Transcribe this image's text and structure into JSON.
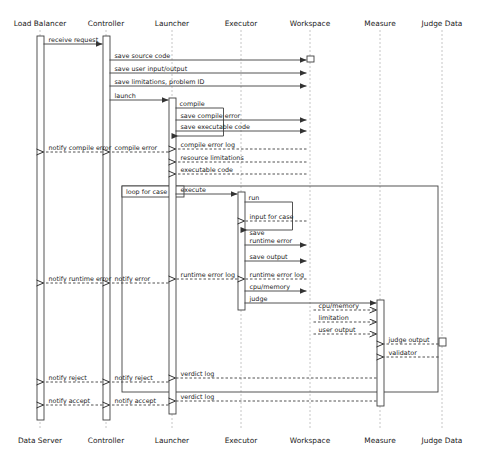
{
  "diagram": {
    "type": "uml-sequence-diagram",
    "title": "",
    "colors": {
      "line": "#404040",
      "text": "#1a1a1a",
      "activation_fill": "#ffffff",
      "background": "#ffffff"
    },
    "header_participants": [
      {
        "id": "load_balancer",
        "label": "Load Balancer",
        "x": 40
      },
      {
        "id": "controller",
        "label": "Controller",
        "x": 106
      },
      {
        "id": "launcher",
        "label": "Launcher",
        "x": 172
      },
      {
        "id": "executor",
        "label": "Executor",
        "x": 241
      },
      {
        "id": "workspace",
        "label": "Workspace",
        "x": 310
      },
      {
        "id": "measure",
        "label": "Measure",
        "x": 380
      },
      {
        "id": "judge_data",
        "label": "Judge Data",
        "x": 442
      }
    ],
    "footer_participants": [
      {
        "id": "data_server",
        "label": "Data Server",
        "x": 40
      },
      {
        "id": "controller",
        "label": "Controller",
        "x": 106
      },
      {
        "id": "launcher",
        "label": "Launcher",
        "x": 172
      },
      {
        "id": "executor",
        "label": "Executor",
        "x": 241
      },
      {
        "id": "workspace",
        "label": "Workspace",
        "x": 310
      },
      {
        "id": "measure",
        "label": "Measure",
        "x": 380
      },
      {
        "id": "judge_data",
        "label": "Judge Data",
        "x": 442
      }
    ],
    "fragments": [
      {
        "id": "loop-for-case",
        "label": "loop for case",
        "x": 122,
        "y": 186,
        "width": 316,
        "height": 206
      }
    ],
    "messages": [
      {
        "id": "m1",
        "label": "receive request",
        "from": "load_balancer",
        "to": "controller",
        "y": 44,
        "style": "solid",
        "dir": "right"
      },
      {
        "id": "m2",
        "label": "save source code",
        "from": "controller",
        "to": "workspace",
        "y": 60,
        "style": "solid",
        "dir": "right"
      },
      {
        "id": "m3",
        "label": "save user input/output",
        "from": "controller",
        "to": "workspace",
        "y": 73,
        "style": "solid",
        "dir": "right"
      },
      {
        "id": "m4",
        "label": "save limitations, problem ID",
        "from": "controller",
        "to": "workspace",
        "y": 86,
        "style": "solid",
        "dir": "right"
      },
      {
        "id": "m5",
        "label": "launch",
        "from": "controller",
        "to": "launcher",
        "y": 100,
        "style": "solid",
        "dir": "right"
      },
      {
        "id": "m6",
        "label": "compile",
        "from": "launcher",
        "to": "launcher",
        "y": 108,
        "style": "solid",
        "dir": "self"
      },
      {
        "id": "m7",
        "label": "save compile error",
        "from": "launcher",
        "to": "workspace",
        "y": 120,
        "style": "solid",
        "dir": "right"
      },
      {
        "id": "m8",
        "label": "save executable code",
        "from": "launcher",
        "to": "workspace",
        "y": 131,
        "style": "solid",
        "dir": "right"
      },
      {
        "id": "m9",
        "label": "compile error log",
        "from": "workspace",
        "to": "launcher",
        "y": 149,
        "style": "dashed",
        "dir": "left"
      },
      {
        "id": "m10",
        "label": "resource limitations",
        "from": "workspace",
        "to": "launcher",
        "y": 162,
        "style": "dashed",
        "dir": "left"
      },
      {
        "id": "m11",
        "label": "executable code",
        "from": "workspace",
        "to": "launcher",
        "y": 174,
        "style": "dashed",
        "dir": "left"
      },
      {
        "id": "m12",
        "label": "compile error",
        "from": "launcher",
        "to": "controller",
        "y": 152,
        "style": "dashed",
        "dir": "left"
      },
      {
        "id": "m13",
        "label": "notify compile error",
        "from": "controller",
        "to": "load_balancer",
        "y": 152,
        "style": "dashed",
        "dir": "left"
      },
      {
        "id": "m14",
        "label": "execute",
        "from": "launcher",
        "to": "executor",
        "y": 194,
        "style": "solid",
        "dir": "right"
      },
      {
        "id": "m15",
        "label": "run",
        "from": "executor",
        "to": "executor",
        "y": 202,
        "style": "solid",
        "dir": "self"
      },
      {
        "id": "m16",
        "label": "input for case",
        "from": "workspace",
        "to": "executor",
        "y": 221,
        "style": "dashed",
        "dir": "left"
      },
      {
        "id": "m17",
        "label": "save\nruntime error",
        "from": "executor",
        "to": "workspace",
        "y": 245,
        "style": "solid",
        "dir": "right"
      },
      {
        "id": "m18",
        "label": "save output",
        "from": "executor",
        "to": "workspace",
        "y": 261,
        "style": "solid",
        "dir": "right"
      },
      {
        "id": "m19",
        "label": "runtime error log",
        "from": "workspace",
        "to": "executor",
        "y": 279,
        "style": "dashed",
        "dir": "left"
      },
      {
        "id": "m20",
        "label": "runtime error log",
        "from": "executor",
        "to": "launcher",
        "y": 279,
        "style": "dashed",
        "dir": "left"
      },
      {
        "id": "m21",
        "label": "notify error",
        "from": "launcher",
        "to": "controller",
        "y": 283,
        "style": "dashed",
        "dir": "left"
      },
      {
        "id": "m22",
        "label": "notify runtime error",
        "from": "controller",
        "to": "load_balancer",
        "y": 283,
        "style": "dashed",
        "dir": "left"
      },
      {
        "id": "m23",
        "label": "cpu/memory",
        "from": "executor",
        "to": "workspace",
        "y": 291,
        "style": "solid",
        "dir": "right"
      },
      {
        "id": "m24",
        "label": "judge",
        "from": "executor",
        "to": "measure",
        "y": 303,
        "style": "solid",
        "dir": "right"
      },
      {
        "id": "m25",
        "label": "cpu/memory",
        "from": "workspace",
        "to": "measure",
        "y": 310,
        "style": "dashed",
        "dir": "right"
      },
      {
        "id": "m26",
        "label": "limitation",
        "from": "workspace",
        "to": "measure",
        "y": 322,
        "style": "dashed",
        "dir": "right"
      },
      {
        "id": "m27",
        "label": "user output",
        "from": "workspace",
        "to": "measure",
        "y": 334,
        "style": "dashed",
        "dir": "right"
      },
      {
        "id": "m28",
        "label": "judge output",
        "from": "judge_data",
        "to": "measure",
        "y": 344,
        "style": "dashed",
        "dir": "left"
      },
      {
        "id": "m29",
        "label": "validator",
        "from": "judge_data",
        "to": "measure",
        "y": 357,
        "style": "dashed",
        "dir": "left"
      },
      {
        "id": "m30",
        "label": "verdict log",
        "from": "measure",
        "to": "launcher",
        "y": 378,
        "style": "dashed",
        "dir": "left"
      },
      {
        "id": "m31",
        "label": "notify reject",
        "from": "launcher",
        "to": "controller",
        "y": 382,
        "style": "dashed",
        "dir": "left"
      },
      {
        "id": "m32",
        "label": "notify reject",
        "from": "controller",
        "to": "load_balancer",
        "y": 382,
        "style": "dashed",
        "dir": "left"
      },
      {
        "id": "m33",
        "label": "verdict log",
        "from": "measure",
        "to": "launcher",
        "y": 401,
        "style": "dashed",
        "dir": "left"
      },
      {
        "id": "m34",
        "label": "notify accept",
        "from": "launcher",
        "to": "controller",
        "y": 405,
        "style": "dashed",
        "dir": "left"
      },
      {
        "id": "m35",
        "label": "notify accept",
        "from": "controller",
        "to": "load_balancer",
        "y": 405,
        "style": "dashed",
        "dir": "left"
      }
    ],
    "activations": [
      {
        "id": "act-load-balancer",
        "participant": "load_balancer",
        "x": 37,
        "y": 36,
        "width": 7,
        "height": 384
      },
      {
        "id": "act-controller",
        "participant": "controller",
        "x": 103,
        "y": 36,
        "width": 7,
        "height": 384
      },
      {
        "id": "act-launcher",
        "participant": "launcher",
        "x": 169,
        "y": 98,
        "width": 7,
        "height": 316
      },
      {
        "id": "act-executor",
        "participant": "executor",
        "x": 238,
        "y": 192,
        "width": 7,
        "height": 118
      },
      {
        "id": "act-workspace",
        "participant": "workspace",
        "x": 307,
        "y": 56,
        "width": 7,
        "height": 6
      },
      {
        "id": "act-measure",
        "participant": "measure",
        "x": 377,
        "y": 300,
        "width": 7,
        "height": 106
      },
      {
        "id": "act-judge-data",
        "participant": "judge_data",
        "x": 439,
        "y": 338,
        "width": 7,
        "height": 8
      }
    ]
  }
}
